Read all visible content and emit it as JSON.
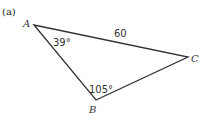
{
  "figure": {
    "caption": "(a)",
    "vertices": {
      "A": {
        "label": "A"
      },
      "B": {
        "label": "B"
      },
      "C": {
        "label": "C"
      }
    },
    "side_AC": "60",
    "angle_A": "39°",
    "angle_B": "105°"
  }
}
